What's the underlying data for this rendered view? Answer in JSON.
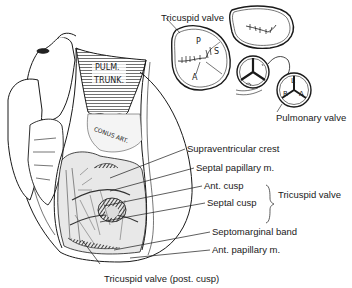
{
  "figure": {
    "labels": {
      "tricuspid_valve_top": "Tricuspid valve",
      "pulmonary_valve": "Pulmonary valve",
      "supraventricular_crest": "Supraventricular crest",
      "septal_papillary": "Septal papillary m.",
      "ant_cusp": "Ant. cusp",
      "septal_cusp": "Septal cusp",
      "tricuspid_valve_bracket": "Tricuspid valve",
      "septomarginal_band": "Septomarginal band",
      "ant_papillary": "Ant. papillary m.",
      "tricuspid_post_cusp": "Tricuspid valve (post. cusp)"
    },
    "inscriptions": {
      "pulm": "PULM.",
      "trunk": "TRUNK.",
      "conus": "CONUS ART."
    },
    "valve_letters": {
      "tricuspid_p": "P",
      "tricuspid_s": "S",
      "tricuspid_a": "A",
      "pulmonary_l": "L",
      "pulmonary_r": "R",
      "pulmonary_a": "A"
    },
    "colors": {
      "ink": "#1a1a1a",
      "background": "#ffffff",
      "shade": "#555555"
    }
  }
}
